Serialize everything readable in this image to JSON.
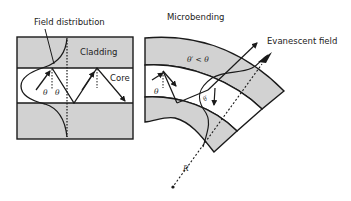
{
  "colors": {
    "cladding_fill": "#d2d2d2",
    "core_fill": "#ffffff",
    "stroke": "#1a1a1a"
  },
  "left_panel": {
    "title": "Field distribution",
    "cladding_label": "Cladding",
    "core_label": "Core",
    "angle_label_1": "θ",
    "angle_label_2": "θ"
  },
  "right_panel": {
    "title": "Microbending",
    "evanescent_label": "Evanescent field",
    "angle_relation": "θ′ < θ",
    "angle_label": "θ",
    "angle_label_prime": "θ′",
    "radius_label": "R"
  }
}
